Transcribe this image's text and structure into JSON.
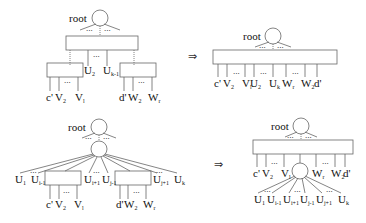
{
  "colors": {
    "stroke": "#666666",
    "text": "#111111",
    "background": "#ffffff"
  },
  "arrow_symbol": "⇒",
  "panels": {
    "top_left": {
      "root": "root",
      "mid_labels": [
        {
          "base": "U",
          "sub": "2"
        },
        {
          "base": "U",
          "sub": "k-1"
        }
      ],
      "left_leaves": [
        {
          "base": "c'",
          "sub": ""
        },
        {
          "base": "V",
          "sub": "2"
        },
        {
          "base": "V",
          "sub": "l"
        }
      ],
      "right_leaves": [
        {
          "base": "d'",
          "sub": ""
        },
        {
          "base": "W",
          "sub": "2"
        },
        {
          "base": "W",
          "sub": "r"
        }
      ]
    },
    "top_right": {
      "root": "root",
      "leaves": [
        {
          "base": "c'",
          "sub": ""
        },
        {
          "base": "V",
          "sub": "2"
        },
        {
          "base": "V",
          "sub": "l"
        },
        {
          "base": "U",
          "sub": "2"
        },
        {
          "base": "U",
          "sub": "k"
        },
        {
          "base": "W",
          "sub": "r"
        },
        {
          "base": "W",
          "sub": "2"
        },
        {
          "base": "d'",
          "sub": ""
        }
      ]
    },
    "bottom_left": {
      "root": "root",
      "u_labels": [
        {
          "base": "U",
          "sub": "1"
        },
        {
          "base": "U",
          "sub": "i-1"
        },
        {
          "base": "U",
          "sub": "i+1"
        },
        {
          "base": "U",
          "sub": "j-1"
        },
        {
          "base": "U",
          "sub": "j+1"
        },
        {
          "base": "U",
          "sub": "k"
        }
      ],
      "left_leaves": [
        {
          "base": "c'",
          "sub": ""
        },
        {
          "base": "V",
          "sub": "2"
        },
        {
          "base": "V",
          "sub": "l"
        }
      ],
      "right_leaves": [
        {
          "base": "d'",
          "sub": ""
        },
        {
          "base": "W",
          "sub": "2"
        },
        {
          "base": "W",
          "sub": "r"
        }
      ]
    },
    "bottom_right": {
      "root": "root",
      "leaves": [
        {
          "base": "c'",
          "sub": ""
        },
        {
          "base": "V",
          "sub": "2"
        },
        {
          "base": "V",
          "sub": "l"
        },
        {
          "base": "W",
          "sub": "r"
        },
        {
          "base": "W",
          "sub": "2"
        },
        {
          "base": "d'",
          "sub": ""
        }
      ],
      "u_labels": [
        {
          "base": "U",
          "sub": "1"
        },
        {
          "base": "U",
          "sub": "i-1"
        },
        {
          "base": "U",
          "sub": "i+1"
        },
        {
          "base": "U",
          "sub": "j-1"
        },
        {
          "base": "U",
          "sub": "j+1"
        },
        {
          "base": "U",
          "sub": "k"
        }
      ]
    }
  }
}
